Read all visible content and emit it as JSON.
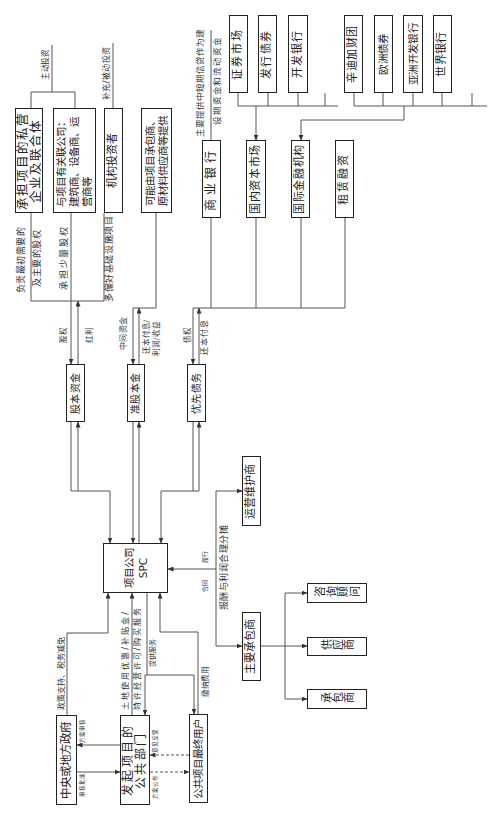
{
  "boxes": {
    "private_consortium": [
      "承担项目的私营",
      "企业及联合体"
    ],
    "related_companies": [
      "与项目有关联公司：",
      "建筑商、设备商、运",
      "营商等"
    ],
    "institutional_investors": [
      "机构投资者"
    ],
    "contractor_supplier_provided": [
      "可能由项目承包商、",
      "原材料供应商等提供"
    ],
    "equity_capital": [
      "股本资金"
    ],
    "quasi_equity": [
      "准股本金"
    ],
    "senior_debt": [
      "优先债务"
    ],
    "spc": [
      "项目公司",
      "SPC"
    ],
    "om_operator": [
      "运营维护商"
    ],
    "main_contractor": [
      "主要承包商"
    ],
    "consultant": [
      "咨询顾问"
    ],
    "supplier": [
      "供应商"
    ],
    "contractor": [
      "承包商"
    ],
    "government": [
      "中央或地方政府"
    ],
    "public_sponsor": [
      "发起项目的",
      "公共部门"
    ],
    "end_users": [
      "公共项目最终用户"
    ],
    "commercial_bank": [
      "商业银行"
    ],
    "domestic_capital_market": [
      "国内资本市场"
    ],
    "intl_financial_institutions": [
      "国际金融机构"
    ],
    "leasing_finance": [
      "租赁融资"
    ],
    "securities_market": [
      "证券市场"
    ],
    "bond_issuance": [
      "发行债券"
    ],
    "development_bank": [
      "开发银行"
    ],
    "syndicate": [
      "辛迪加财团"
    ],
    "eurobond": [
      "欧洲债券"
    ],
    "adb": [
      "亚洲开发银行"
    ],
    "world_bank": [
      "世界银行"
    ]
  },
  "labels": {
    "active_investment": "主动投资",
    "passive_investment": "补充/被动投资",
    "initial_equity_1": "负责最初需要的",
    "initial_equity_2": "及主要的股权",
    "minor_equity": "承担少量股权",
    "infra_preference": "多偏好基础设施项目",
    "equity": "股权",
    "dividend": "红利",
    "mezzanine_funds": "中间资金",
    "quasi_return_1": "还本付息/",
    "quasi_return_2": "利润/收益",
    "creditor_rights": "债权",
    "debt_service": "还本付息",
    "commercial_bank_note_1": "主要提供中短期信贷作为建",
    "commercial_bank_note_2": "设期资金和流动资金",
    "policy_support": "政策支持、税务减免",
    "concession_1": "土地使用优惠/补贴金/",
    "concession_2": "特许经营许可/购买服务",
    "provide_services": "提供服务",
    "pay_fees": "缴纳费用",
    "contract": "合同",
    "perform": "履行",
    "remuneration": "报酬与利润合理分摊",
    "scheme_review": "方案审核",
    "approval": "审核批准",
    "feedback": "意见反馈",
    "scheme_publication": "方案公布"
  },
  "colors": {
    "line": "#555555",
    "box_border": "#222222",
    "background": "#ffffff"
  }
}
